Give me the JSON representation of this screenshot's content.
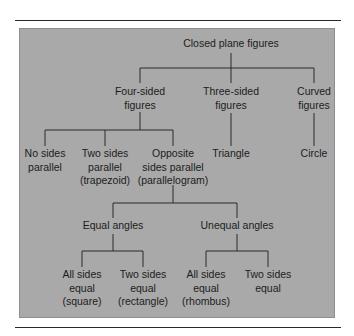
{
  "diagram": {
    "type": "tree",
    "colors": {
      "panel_fill": "#a9a9a9",
      "line": "#2b2b2b",
      "text": "#1c1c1c",
      "rule": "#2a2a2a"
    },
    "root": {
      "label": [
        "Closed plane figures"
      ]
    },
    "level1": [
      {
        "label": [
          "Four-sided",
          "figures"
        ]
      },
      {
        "label": [
          "Three-sided",
          "figures"
        ]
      },
      {
        "label": [
          "Curved",
          "figures"
        ]
      }
    ],
    "level2": [
      {
        "parent": "Four-sided figures",
        "label": [
          "No sides",
          "parallel"
        ]
      },
      {
        "parent": "Four-sided figures",
        "label": [
          "Two sides",
          "parallel",
          "(trapezoid)"
        ]
      },
      {
        "parent": "Four-sided figures",
        "label": [
          "Opposite",
          "sides parallel",
          "(parallelogram)"
        ]
      },
      {
        "parent": "Three-sided figures",
        "label": [
          "Triangle"
        ]
      },
      {
        "parent": "Curved figures",
        "label": [
          "Circle"
        ]
      }
    ],
    "level3": [
      {
        "parent": "Opposite sides parallel (parallelogram)",
        "label": [
          "Equal angles"
        ]
      },
      {
        "parent": "Opposite sides parallel (parallelogram)",
        "label": [
          "Unequal angles"
        ]
      }
    ],
    "level4": [
      {
        "parent": "Equal angles",
        "label": [
          "All sides",
          "equal",
          "(square)"
        ]
      },
      {
        "parent": "Equal angles",
        "label": [
          "Two sides",
          "equal",
          "(rectangle)"
        ]
      },
      {
        "parent": "Unequal angles",
        "label": [
          "All sides",
          "equal",
          "(rhombus)"
        ]
      },
      {
        "parent": "Unequal angles",
        "label": [
          "Two sides",
          "equal"
        ]
      }
    ]
  }
}
